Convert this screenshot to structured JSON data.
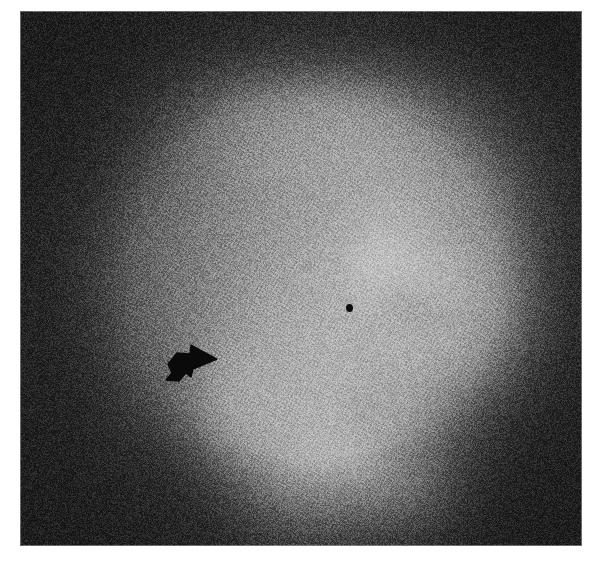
{
  "figure": {
    "kind": "radiograph",
    "modality": "barium-contrast-upper-gi",
    "orientation": "lateral-oblique",
    "caption": "",
    "background_color": "#ffffff",
    "plate": {
      "x": 20,
      "y": 11,
      "width": 562,
      "height": 535,
      "border_color": "#b8b8b8",
      "film_base_color": "#2e2e2e",
      "film_dark_color": "#1a1a1a",
      "film_bright_color": "#f7f7f7",
      "grain": "halftone-print-grain"
    }
  },
  "annotations": [
    {
      "id": "arrow-1",
      "type": "arrowhead",
      "label": "",
      "color": "#0a0a0a",
      "x": 143,
      "y": 329,
      "width": 56,
      "height": 46,
      "direction": "right"
    },
    {
      "id": "dot-1",
      "type": "dot-marker",
      "label": "",
      "color": "#0b0b0b",
      "x": 326,
      "y": 293,
      "width": 7,
      "height": 8
    }
  ],
  "image_regions": {
    "description": "Grayscale density field of the radiograph",
    "dark_surround": "outer frame of exposed film, near-black with print grain",
    "bright_contrast_pool": "central and right barium-filled lumen, near-white",
    "mid_gray_soft_tissue": "left and upper soft tissue shadow, mid gray",
    "mucosal_folds": "mottled light/dark striations upper-right and lower-center"
  },
  "density_field": {
    "note": "Normalized luminance blobs used to synthesize the film. x,y in plate coords (562x535). r = radius, l = luminance 0-255, s = softness.",
    "base_luminance": 46,
    "blobs": [
      {
        "x": 300,
        "y": 275,
        "rx": 230,
        "ry": 250,
        "l": 86,
        "s": 1.0
      },
      {
        "x": 300,
        "y": 300,
        "rx": 190,
        "ry": 215,
        "l": 120,
        "s": 1.0
      },
      {
        "x": 250,
        "y": 230,
        "rx": 150,
        "ry": 185,
        "l": 150,
        "s": 1.0
      },
      {
        "x": 170,
        "y": 250,
        "rx": 95,
        "ry": 160,
        "l": 138,
        "s": 1.0
      },
      {
        "x": 120,
        "y": 300,
        "rx": 70,
        "ry": 150,
        "l": 112,
        "s": 1.0
      },
      {
        "x": 330,
        "y": 175,
        "rx": 165,
        "ry": 125,
        "l": 186,
        "s": 1.0
      },
      {
        "x": 400,
        "y": 140,
        "rx": 140,
        "ry": 95,
        "l": 205,
        "s": 1.0
      },
      {
        "x": 300,
        "y": 110,
        "rx": 130,
        "ry": 80,
        "l": 178,
        "s": 1.0
      },
      {
        "x": 430,
        "y": 200,
        "rx": 95,
        "ry": 80,
        "l": 190,
        "s": 1.0
      },
      {
        "x": 330,
        "y": 300,
        "rx": 125,
        "ry": 140,
        "l": 232,
        "s": 1.0
      },
      {
        "x": 270,
        "y": 330,
        "rx": 95,
        "ry": 140,
        "l": 238,
        "s": 1.0
      },
      {
        "x": 390,
        "y": 250,
        "rx": 95,
        "ry": 95,
        "l": 236,
        "s": 1.0
      },
      {
        "x": 415,
        "y": 330,
        "rx": 115,
        "ry": 110,
        "l": 240,
        "s": 1.0
      },
      {
        "x": 330,
        "y": 420,
        "rx": 95,
        "ry": 90,
        "l": 234,
        "s": 1.0
      },
      {
        "x": 280,
        "y": 470,
        "rx": 80,
        "ry": 75,
        "l": 228,
        "s": 1.0
      },
      {
        "x": 390,
        "y": 480,
        "rx": 70,
        "ry": 60,
        "l": 222,
        "s": 1.0
      },
      {
        "x": 470,
        "y": 290,
        "rx": 70,
        "ry": 90,
        "l": 210,
        "s": 1.0
      },
      {
        "x": 215,
        "y": 395,
        "rx": 55,
        "ry": 80,
        "l": 225,
        "s": 1.0
      },
      {
        "x": 360,
        "y": 250,
        "rx": 40,
        "ry": 45,
        "l": 245,
        "s": 1.0
      }
    ],
    "dark_blobs": [
      {
        "x": 470,
        "y": 120,
        "rx": 120,
        "ry": 130,
        "l": 28,
        "s": 1.0
      },
      {
        "x": 520,
        "y": 300,
        "rx": 90,
        "ry": 160,
        "l": 30,
        "s": 1.0
      },
      {
        "x": 500,
        "y": 450,
        "rx": 130,
        "ry": 110,
        "l": 26,
        "s": 1.0
      },
      {
        "x": 70,
        "y": 120,
        "rx": 110,
        "ry": 130,
        "l": 26,
        "s": 1.0
      },
      {
        "x": 55,
        "y": 350,
        "rx": 80,
        "ry": 180,
        "l": 28,
        "s": 1.0
      },
      {
        "x": 150,
        "y": 480,
        "rx": 130,
        "ry": 90,
        "l": 34,
        "s": 1.0
      },
      {
        "x": 300,
        "y": 30,
        "rx": 230,
        "ry": 55,
        "l": 30,
        "s": 1.0
      },
      {
        "x": 380,
        "y": 290,
        "rx": 34,
        "ry": 26,
        "l": 96,
        "s": 0.9
      },
      {
        "x": 412,
        "y": 305,
        "rx": 42,
        "ry": 20,
        "l": 104,
        "s": 0.9
      },
      {
        "x": 352,
        "y": 360,
        "rx": 22,
        "ry": 40,
        "l": 130,
        "s": 0.9
      },
      {
        "x": 340,
        "y": 400,
        "rx": 30,
        "ry": 22,
        "l": 120,
        "s": 0.9
      },
      {
        "x": 385,
        "y": 440,
        "rx": 38,
        "ry": 22,
        "l": 90,
        "s": 0.9
      },
      {
        "x": 430,
        "y": 215,
        "rx": 30,
        "ry": 22,
        "l": 118,
        "s": 0.9
      },
      {
        "x": 455,
        "y": 160,
        "rx": 26,
        "ry": 22,
        "l": 130,
        "s": 0.9
      },
      {
        "x": 330,
        "y": 145,
        "rx": 30,
        "ry": 20,
        "l": 150,
        "s": 0.9
      },
      {
        "x": 250,
        "y": 160,
        "rx": 36,
        "ry": 20,
        "l": 150,
        "s": 0.9
      },
      {
        "x": 305,
        "y": 490,
        "rx": 28,
        "ry": 26,
        "l": 128,
        "s": 0.9
      }
    ]
  }
}
